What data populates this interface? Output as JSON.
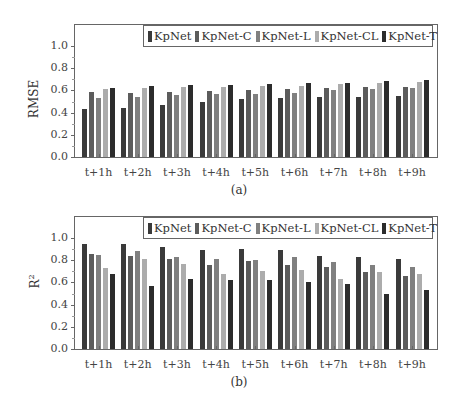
{
  "series_colors": {
    "KpNet": "#3a3a3a",
    "KpNet-C": "#5c5c5c",
    "KpNet-L": "#808080",
    "KpNet-CL": "#acacac",
    "KpNet-T": "#2c2c2c"
  },
  "legend": [
    "KpNet",
    "KpNet-C",
    "KpNet-L",
    "KpNet-CL",
    "KpNet-T"
  ],
  "yticks": [
    "0.0",
    "0.2",
    "0.4",
    "0.6",
    "0.8",
    "1.0"
  ],
  "categories": [
    "t+1h",
    "t+2h",
    "t+3h",
    "t+4h",
    "t+5h",
    "t+6h",
    "t+7h",
    "t+8h",
    "t+9h"
  ],
  "panels": {
    "a": {
      "ylabel": "RMSE",
      "caption": "(a)"
    },
    "b": {
      "ylabel": "R",
      "ylabel_sup": "2",
      "caption": "(b)"
    }
  },
  "chart_data": [
    {
      "type": "bar",
      "title": "",
      "caption": "(a)",
      "xlabel": "",
      "ylabel": "RMSE",
      "ylim": [
        0,
        1.2
      ],
      "yticks": [
        0.0,
        0.2,
        0.4,
        0.6,
        0.8,
        1.0
      ],
      "grid": false,
      "legend_position": "upper right",
      "categories": [
        "t+1h",
        "t+2h",
        "t+3h",
        "t+4h",
        "t+5h",
        "t+6h",
        "t+7h",
        "t+8h",
        "t+9h"
      ],
      "series": [
        {
          "name": "KpNet",
          "values": [
            0.43,
            0.44,
            0.465,
            0.5,
            0.525,
            0.53,
            0.54,
            0.545,
            0.55
          ]
        },
        {
          "name": "KpNet-C",
          "values": [
            0.585,
            0.575,
            0.585,
            0.595,
            0.605,
            0.61,
            0.62,
            0.63,
            0.635
          ]
        },
        {
          "name": "KpNet-L",
          "values": [
            0.535,
            0.54,
            0.555,
            0.565,
            0.57,
            0.58,
            0.6,
            0.615,
            0.625
          ]
        },
        {
          "name": "KpNet-CL",
          "values": [
            0.615,
            0.62,
            0.63,
            0.63,
            0.64,
            0.64,
            0.655,
            0.665,
            0.675
          ]
        },
        {
          "name": "KpNet-T",
          "values": [
            0.625,
            0.64,
            0.645,
            0.645,
            0.655,
            0.665,
            0.665,
            0.685,
            0.69
          ]
        }
      ]
    },
    {
      "type": "bar",
      "title": "",
      "caption": "(b)",
      "xlabel": "",
      "ylabel": "R^2",
      "ylim": [
        0,
        1.2
      ],
      "yticks": [
        0.0,
        0.2,
        0.4,
        0.6,
        0.8,
        1.0
      ],
      "grid": false,
      "legend_position": "upper right",
      "categories": [
        "t+1h",
        "t+2h",
        "t+3h",
        "t+4h",
        "t+5h",
        "t+6h",
        "t+7h",
        "t+8h",
        "t+9h"
      ],
      "series": [
        {
          "name": "KpNet",
          "values": [
            0.95,
            0.95,
            0.92,
            0.89,
            0.9,
            0.89,
            0.84,
            0.83,
            0.81
          ]
        },
        {
          "name": "KpNet-C",
          "values": [
            0.855,
            0.84,
            0.815,
            0.76,
            0.79,
            0.76,
            0.74,
            0.69,
            0.66
          ]
        },
        {
          "name": "KpNet-L",
          "values": [
            0.85,
            0.885,
            0.83,
            0.815,
            0.8,
            0.83,
            0.78,
            0.76,
            0.735
          ]
        },
        {
          "name": "KpNet-CL",
          "values": [
            0.73,
            0.81,
            0.77,
            0.68,
            0.705,
            0.71,
            0.63,
            0.69,
            0.68
          ]
        },
        {
          "name": "KpNet-T",
          "values": [
            0.68,
            0.57,
            0.63,
            0.625,
            0.62,
            0.6,
            0.59,
            0.5,
            0.53
          ]
        }
      ]
    }
  ]
}
